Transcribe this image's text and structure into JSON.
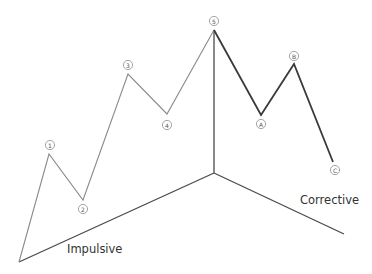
{
  "diagram": {
    "labels": {
      "impulsive": "Impulsive",
      "corrective": "Corrective"
    },
    "markers": [
      {
        "id": "1",
        "label": "1",
        "x": 50,
        "y": 145
      },
      {
        "id": "2",
        "label": "2",
        "x": 83,
        "y": 209
      },
      {
        "id": "3",
        "label": "3",
        "x": 128,
        "y": 65
      },
      {
        "id": "4",
        "label": "4",
        "x": 167,
        "y": 125
      },
      {
        "id": "5",
        "label": "5",
        "x": 214,
        "y": 21
      },
      {
        "id": "A",
        "label": "A",
        "x": 261,
        "y": 124
      },
      {
        "id": "B",
        "label": "B",
        "x": 294,
        "y": 56
      },
      {
        "id": "C",
        "label": "C",
        "x": 335,
        "y": 170
      }
    ],
    "impulse_path": [
      [
        19,
        262
      ],
      [
        49,
        154
      ],
      [
        83,
        200
      ],
      [
        128,
        74
      ],
      [
        167,
        114
      ],
      [
        214,
        30
      ]
    ],
    "corrective_path": [
      [
        214,
        30
      ],
      [
        261,
        115
      ],
      [
        294,
        64
      ],
      [
        333,
        162
      ]
    ],
    "axes": {
      "origin": [
        19,
        262
      ],
      "vertex": [
        214,
        173
      ],
      "top": [
        214,
        30
      ],
      "right_end": [
        344,
        234
      ]
    },
    "colors": {
      "impulse_line": "#8a8a8a",
      "corrective_line": "#3a3a3a",
      "axis_line": "#4a4a4a",
      "text": "#333333"
    }
  }
}
